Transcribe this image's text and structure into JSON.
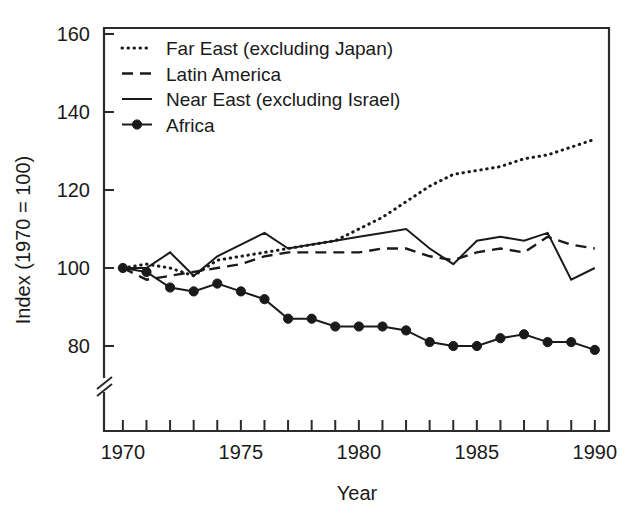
{
  "chart_data": {
    "type": "line",
    "title": "",
    "xlabel": "Year",
    "ylabel": "Index (1970 = 100)",
    "xlim": [
      1969.2,
      1990.6
    ],
    "ylim": [
      72,
      160
    ],
    "y_axis_break": true,
    "grid": false,
    "legend_position": "top-left",
    "x": [
      1970,
      1971,
      1972,
      1973,
      1974,
      1975,
      1976,
      1977,
      1978,
      1979,
      1980,
      1981,
      1982,
      1983,
      1984,
      1985,
      1986,
      1987,
      1988,
      1989,
      1990
    ],
    "xticks": [
      1970,
      1971,
      1972,
      1973,
      1974,
      1975,
      1976,
      1977,
      1978,
      1979,
      1980,
      1981,
      1982,
      1983,
      1984,
      1985,
      1986,
      1987,
      1988,
      1989,
      1990
    ],
    "xtick_labels": [
      "1970",
      "",
      "",
      "",
      "",
      "1975",
      "",
      "",
      "",
      "",
      "1980",
      "",
      "",
      "",
      "",
      "1985",
      "",
      "",
      "",
      "",
      "1990"
    ],
    "yticks": [
      80,
      100,
      120,
      140,
      160
    ],
    "ytick_labels": [
      "80",
      "100",
      "120",
      "140",
      "160"
    ],
    "series": [
      {
        "name": "Far East (excluding Japan)",
        "style": "dotted",
        "markers": false,
        "values": [
          100,
          101,
          100,
          98,
          102,
          103,
          104,
          105,
          106,
          107,
          110,
          113,
          117,
          121,
          124,
          125,
          126,
          128,
          129,
          131,
          133
        ]
      },
      {
        "name": "Latin America",
        "style": "dashed",
        "markers": false,
        "values": [
          100,
          97,
          98,
          99,
          100,
          101,
          103,
          104,
          104,
          104,
          104,
          105,
          105,
          103,
          102,
          104,
          105,
          104,
          108,
          106,
          105
        ]
      },
      {
        "name": "Near East (excluding Israel)",
        "style": "solid",
        "markers": false,
        "values": [
          100,
          100,
          104,
          98,
          103,
          106,
          109,
          105,
          106,
          107,
          108,
          109,
          110,
          105,
          101,
          107,
          108,
          107,
          109,
          97,
          100
        ]
      },
      {
        "name": "Africa",
        "style": "solid-marker",
        "markers": true,
        "values": [
          100,
          99,
          95,
          94,
          96,
          94,
          92,
          87,
          87,
          85,
          85,
          85,
          84,
          81,
          80,
          80,
          82,
          83,
          81,
          81,
          79
        ]
      }
    ]
  },
  "legend": {
    "entries": [
      {
        "label": "Far East (excluding Japan)",
        "style": "dotted"
      },
      {
        "label": "Latin America",
        "style": "dashed"
      },
      {
        "label": "Near East (excluding Israel)",
        "style": "solid"
      },
      {
        "label": "Africa",
        "style": "solid-marker"
      }
    ]
  },
  "axes": {
    "x_title": "Year",
    "y_title": "Index (1970 = 100)"
  },
  "colors": {
    "ink": "#1a1a1a",
    "frame": "#2b2b2b",
    "background": "#ffffff"
  }
}
